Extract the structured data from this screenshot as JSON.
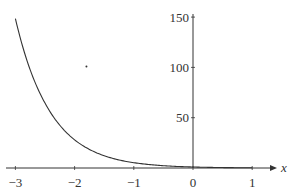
{
  "chart_data": {
    "type": "line",
    "title": "",
    "xlabel": "x",
    "ylabel": "",
    "xlim": [
      -3,
      1
    ],
    "ylim": [
      0,
      150
    ],
    "grid": false,
    "legend": null,
    "x_ticks": [
      -3,
      -2,
      -1,
      0,
      1
    ],
    "x_tick_labels": [
      "−3",
      "−2",
      "−1",
      "0",
      "1"
    ],
    "y_ticks": [
      50,
      100,
      150
    ],
    "y_tick_labels": [
      "50",
      "100",
      "150"
    ],
    "series": [
      {
        "name": "curve",
        "color": "#333333",
        "x": [
          -3,
          -2.75,
          -2.5,
          -2.25,
          -2,
          -1.75,
          -1.5,
          -1.25,
          -1,
          -0.75,
          -0.5,
          -0.25,
          0,
          0.25,
          0.5,
          0.75,
          1
        ],
        "values": [
          148.4,
          97.5,
          64.5,
          42.5,
          28.0,
          18.5,
          12.2,
          8.0,
          5.3,
          3.5,
          2.3,
          1.5,
          1.0,
          0.66,
          0.43,
          0.29,
          0.19
        ]
      }
    ],
    "annotations": [
      {
        "type": "dot",
        "x": -1.8,
        "y": 101
      }
    ]
  },
  "colors": {
    "axis": "#333333",
    "curve": "#333333",
    "background": "#ffffff"
  }
}
